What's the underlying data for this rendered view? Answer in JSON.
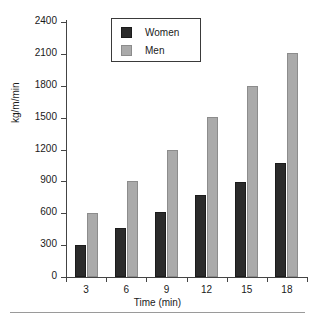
{
  "chart_data": {
    "type": "bar",
    "title": "",
    "subtitle": "",
    "xlabel": "Time (min)",
    "ylabel": "kg/m/min",
    "categories": [
      "3",
      "6",
      "9",
      "12",
      "15",
      "18"
    ],
    "series": [
      {
        "name": "Women",
        "color": "#2b2b2b",
        "values": [
          305,
          465,
          610,
          770,
          895,
          1070
        ]
      },
      {
        "name": "Men",
        "color": "#aaaaaa",
        "values": [
          605,
          900,
          1200,
          1505,
          1800,
          2105
        ]
      }
    ],
    "ylim": [
      0,
      2400
    ],
    "yticks": [
      0,
      300,
      600,
      900,
      1200,
      1500,
      1800,
      2100,
      2400
    ],
    "ytick_labels": [
      "0",
      "300",
      "600",
      "900",
      "1200",
      "1500",
      "1800",
      "2100",
      "2400"
    ],
    "grid": false,
    "legend_position": "top-center",
    "legend_entries": [
      "Women",
      "Men"
    ]
  },
  "legend": {
    "women_label": "Women",
    "men_label": "Men"
  },
  "axes": {
    "y_title": "kg/m/min",
    "x_title": "Time (min)"
  }
}
